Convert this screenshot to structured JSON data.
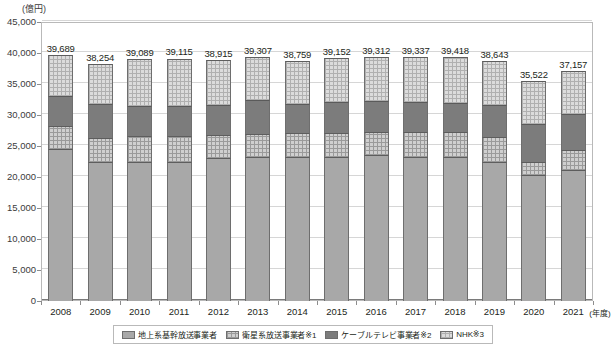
{
  "chart_data": {
    "type": "bar",
    "subtype": "stacked-vertical",
    "title": "",
    "unit_label": "(億円)",
    "xlabel": "(年度)",
    "ylabel": "",
    "ylim": [
      0,
      45000
    ],
    "ytick_step": 5000,
    "ytick_labels": [
      "45,000",
      "40,000",
      "35,000",
      "30,000",
      "25,000",
      "20,000",
      "15,000",
      "10,000",
      "5,000",
      "0"
    ],
    "grid": true,
    "legend_position": "bottom",
    "categories": [
      "2008",
      "2009",
      "2010",
      "2011",
      "2012",
      "2013",
      "2014",
      "2015",
      "2016",
      "2017",
      "2018",
      "2019",
      "2020",
      "2021"
    ],
    "series": [
      {
        "name": "地上系基幹放送事業者",
        "color": "#a8a8a8",
        "values": [
          24500,
          22450,
          22450,
          22400,
          23000,
          23300,
          23250,
          23200,
          23600,
          23250,
          23250,
          22450,
          20250,
          21100
        ]
      },
      {
        "name": "衛星系放送事業者※1",
        "color": "#cfcfcf",
        "values": [
          3800,
          3850,
          4150,
          4200,
          3750,
          3700,
          3800,
          3950,
          3600,
          3950,
          3950,
          4000,
          2100,
          3300
        ]
      },
      {
        "name": "ケーブルテレビ事業者※2",
        "color": "#7c7c7c",
        "values": [
          4700,
          5400,
          4850,
          4800,
          4850,
          5350,
          4800,
          4900,
          5000,
          4900,
          4700,
          5100,
          6150,
          5700
        ]
      },
      {
        "name": "NHK※3",
        "color": "#dcdcdc",
        "values": [
          6689,
          6554,
          7639,
          7715,
          7315,
          6957,
          6909,
          7102,
          7112,
          7237,
          7518,
          7093,
          7022,
          7057
        ]
      }
    ],
    "totals": [
      39689,
      38254,
      39089,
      39115,
      38915,
      39307,
      38759,
      39152,
      39312,
      39337,
      39418,
      38643,
      35522,
      37157
    ],
    "total_labels": [
      "39,689",
      "38,254",
      "39,089",
      "39,115",
      "38,915",
      "39,307",
      "38,759",
      "39,152",
      "39,312",
      "39,337",
      "39,418",
      "38,643",
      "35,522",
      "37,157"
    ]
  },
  "legend": {
    "items": [
      {
        "label": "地上系基幹放送事業者",
        "swatch": "s0"
      },
      {
        "label": "衛星系放送事業者※1",
        "swatch": "s1"
      },
      {
        "label": "ケーブルテレビ事業者※2",
        "swatch": "s2"
      },
      {
        "label": "NHK※3",
        "swatch": "s3"
      }
    ]
  }
}
